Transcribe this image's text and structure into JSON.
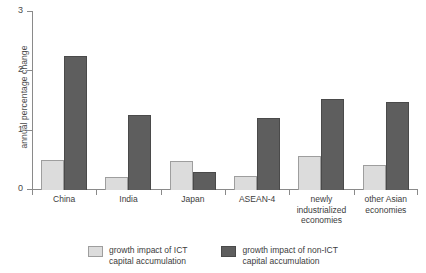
{
  "chart_data": {
    "type": "bar",
    "title": "",
    "xlabel": "",
    "ylabel": "annual percentage change",
    "ylim": [
      0,
      3
    ],
    "yticks": [
      "0",
      "1",
      "2",
      "3"
    ],
    "grid": false,
    "legend_position": "bottom",
    "categories": [
      "China",
      "India",
      "Japan",
      "ASEAN-4",
      "newly\nindustrialized\neconomies",
      "other Asian\neconomies"
    ],
    "series": [
      {
        "name": "growth impact of ICT\ncapital accumulation",
        "color": "#dcdcdc",
        "values": [
          0.5,
          0.22,
          0.48,
          0.23,
          0.57,
          0.42
        ]
      },
      {
        "name": "growth impact of non-ICT\ncapital accumulation",
        "color": "#5e5e5e",
        "values": [
          2.25,
          1.25,
          0.3,
          1.21,
          1.52,
          1.47
        ]
      }
    ]
  },
  "legend": {
    "items": [
      {
        "label": "growth impact of ICT\ncapital accumulation"
      },
      {
        "label": "growth impact of non-ICT\ncapital accumulation"
      }
    ]
  }
}
